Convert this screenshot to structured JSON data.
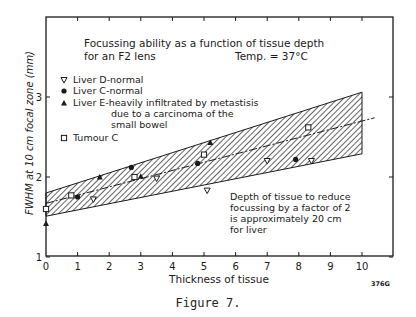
{
  "figure": {
    "caption": "Figure 7.",
    "code": "376G"
  },
  "chart_data": {
    "type": "scatter",
    "title": "Focussing ability as a function of tissue depth for an F2 lens",
    "subtitle": "Temp. = 37°C",
    "xlabel": "Thickness of tissue",
    "ylabel": "FWHM at 10 cm focal zone (mm)",
    "xlim": [
      0,
      10
    ],
    "ylim": [
      1,
      3.5
    ],
    "xticks": [
      "0",
      "1",
      "2",
      "3",
      "4",
      "5",
      "6",
      "7",
      "8",
      "9",
      "10"
    ],
    "yticks": [
      "1",
      "2",
      "3"
    ],
    "grid": false,
    "legend_position": "upper left",
    "legend": [
      {
        "symbol": "triangle-down-open",
        "label": "Liver D-normal"
      },
      {
        "symbol": "circle-filled",
        "label": "Liver C-normal"
      },
      {
        "symbol": "triangle-up-filled",
        "label": "Liver E-heavily infiltrated by metastisis due to a carcinoma of the small bowel"
      },
      {
        "symbol": "square-open",
        "label": "Tumour C"
      }
    ],
    "series": [
      {
        "name": "Liver D-normal",
        "marker": "triangle-down-open",
        "x": [
          1.5,
          3.5,
          5.1,
          7.0,
          8.4
        ],
        "y": [
          1.72,
          1.98,
          1.83,
          2.2,
          2.2
        ]
      },
      {
        "name": "Liver C-normal",
        "marker": "circle-filled",
        "x": [
          1.0,
          2.7,
          4.8,
          7.9
        ],
        "y": [
          1.75,
          2.12,
          2.17,
          2.22
        ]
      },
      {
        "name": "Liver E-heavily infiltrated by metastisis due to a carcinoma of the small bowel",
        "marker": "triangle-up-filled",
        "x": [
          0.0,
          1.7,
          3.0,
          5.2
        ],
        "y": [
          1.42,
          2.0,
          2.01,
          2.43
        ]
      },
      {
        "name": "Tumour C",
        "marker": "square-open",
        "x": [
          0.0,
          0.8,
          2.8,
          5.0,
          8.3
        ],
        "y": [
          1.6,
          1.77,
          2.0,
          2.28,
          2.62
        ]
      }
    ],
    "trend_line": {
      "style": "dash-dot",
      "x": [
        0,
        10.4
      ],
      "y": [
        1.67,
        2.74
      ]
    },
    "confidence_band": {
      "style": "hatched",
      "x": [
        0,
        10
      ],
      "upper": [
        1.8,
        3.06
      ],
      "lower": [
        1.51,
        2.29
      ]
    },
    "annotations": [
      "Depth of tissue to reduce focussing by a factor of 2 is approximately 20 cm for liver"
    ]
  },
  "text": {
    "title_line1": "Focussing ability as a function of tissue depth",
    "title_line2": "for an F2 lens",
    "temp": "Temp. = 37°C",
    "legend1": "Liver D-normal",
    "legend2": "Liver C-normal",
    "legend3a": "Liver E-heavily infiltrated by metastisis",
    "legend3b": "due to a carcinoma of the",
    "legend3c": "small bowel",
    "legend4": "Tumour C",
    "note1": "Depth of tissue to reduce",
    "note2": "focussing by a factor of 2",
    "note3": "is approximately  20 cm",
    "note4": "for liver",
    "xlabel": "Thickness of tissue",
    "ylabel": "FWHM at 10 cm focal zone (mm)"
  }
}
